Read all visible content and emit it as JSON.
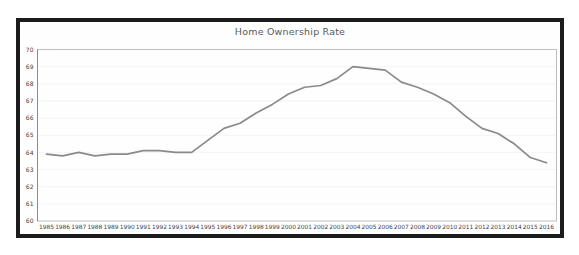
{
  "chart_data": {
    "type": "line",
    "title": "Home Ownership Rate",
    "categories": [
      "1985",
      "1986",
      "1987",
      "1988",
      "1989",
      "1990",
      "1991",
      "1992",
      "1993",
      "1994",
      "1995",
      "1996",
      "1997",
      "1998",
      "1999",
      "2000",
      "2001",
      "2002",
      "2003",
      "2004",
      "2005",
      "2006",
      "2007",
      "2008",
      "2009",
      "2010",
      "2011",
      "2012",
      "2013",
      "2014",
      "2015",
      "2016"
    ],
    "values": [
      63.9,
      63.8,
      64.0,
      63.8,
      63.9,
      63.9,
      64.1,
      64.1,
      64.0,
      64.0,
      64.7,
      65.4,
      65.7,
      66.3,
      66.8,
      67.4,
      67.8,
      67.9,
      68.3,
      69.0,
      68.9,
      68.8,
      68.1,
      67.8,
      67.4,
      66.9,
      66.1,
      65.4,
      65.1,
      64.5,
      63.7,
      63.4
    ],
    "yticks": [
      70,
      69,
      68,
      67,
      66,
      65,
      64,
      63,
      62,
      61,
      60
    ],
    "ylim": [
      60,
      70
    ],
    "grid": "faint",
    "legend": "none",
    "colors": {
      "frame": "#1c1c1c",
      "line": "#8a8a8a",
      "plot_border": "#b8b8b8",
      "y_axis": "#8c8c8c",
      "gridline": "#ededed",
      "title": "#595959",
      "tick_label": "#3f3f3f",
      "background": "#fefefe"
    }
  }
}
